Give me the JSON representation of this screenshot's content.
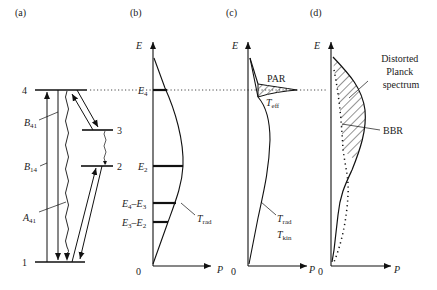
{
  "panels": {
    "a": {
      "tag": "(a)",
      "levels": [
        {
          "label": "4",
          "y": 90
        },
        {
          "label": "3",
          "y": 130
        },
        {
          "label": "2",
          "y": 166
        },
        {
          "label": "1",
          "y": 262
        }
      ],
      "transitions": {
        "B41": {
          "sym": "B",
          "sub": "41"
        },
        "B14": {
          "sym": "B",
          "sub": "14"
        },
        "A41": {
          "sym": "A",
          "sub": "41"
        }
      }
    },
    "b": {
      "tag": "(b)",
      "axis_y": "E",
      "axis_x": "P",
      "origin": "0",
      "marks": {
        "E4": {
          "sym": "E",
          "sub": "4"
        },
        "E2": {
          "sym": "E",
          "sub": "2"
        },
        "E4E3": {
          "a": "E",
          "asub": "4",
          "b": "E",
          "bsub": "3"
        },
        "E3E2": {
          "a": "E",
          "asub": "3",
          "b": "E",
          "bsub": "2"
        }
      },
      "curve_label": {
        "sym": "T",
        "sub": "rad"
      }
    },
    "c": {
      "tag": "(c)",
      "axis_y": "E",
      "axis_x": "P",
      "origin": "0",
      "peak_label": "PAR",
      "teff": {
        "sym": "T",
        "sub": "eff"
      },
      "trad": {
        "sym": "T",
        "sub": "rad"
      },
      "tkin": {
        "sym": "T",
        "sub": "kin"
      }
    },
    "d": {
      "tag": "(d)",
      "axis_y": "E",
      "axis_x": "P",
      "origin": "0",
      "distorted_label": [
        "Distorted",
        "Planck",
        "spectrum"
      ],
      "bbr_label": "BBR"
    }
  },
  "colors": {
    "ink": "#111111",
    "background": "#ffffff"
  }
}
